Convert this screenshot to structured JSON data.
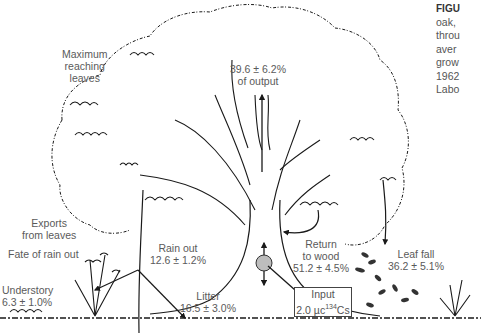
{
  "caption": {
    "heading": "FIGU",
    "lines": [
      "oak,",
      "throu",
      "aver",
      "grow",
      "1962",
      "Labo"
    ]
  },
  "labels": {
    "maximum_reaching": [
      "Maximum",
      "reaching",
      "leaves"
    ],
    "output": [
      "39.6 ± 6.2%",
      "of output"
    ],
    "exports": [
      "Exports",
      "from leaves"
    ],
    "fate": "Fate of rain out",
    "rain_out": [
      "Rain out",
      "12.6 ± 1.2%"
    ],
    "return_wood": [
      "Return",
      "to wood",
      "51.2 ± 4.5%"
    ],
    "leaf_fall": [
      "Leaf fall",
      "36.2 ± 5.1%"
    ],
    "understory": [
      "Understory",
      "6.3 ± 1.0%"
    ],
    "litter": [
      "Litter",
      "16.5 ± 3.0%"
    ],
    "input": {
      "line1": "Input",
      "value": "2.0 µc",
      "isotope_mass": "134",
      "element": "Cs"
    }
  },
  "colors": {
    "ink": "#1a1a1a",
    "text": "#5a5a5a",
    "tracer_fill": "#bdbdbd"
  }
}
